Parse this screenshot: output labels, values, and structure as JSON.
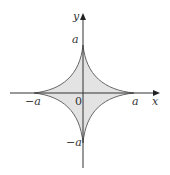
{
  "diagram": {
    "type": "astroid",
    "equation": "x^(2/3) + y^(2/3) = a^(2/3)",
    "fill_color": "#e3e3e3",
    "curve_color": "#555555",
    "axis_color": "#333333"
  },
  "labels": {
    "y_axis": "y",
    "x_axis": "x",
    "top": "a",
    "bottom": "−a",
    "left": "−a",
    "right": "a",
    "origin": "0"
  }
}
